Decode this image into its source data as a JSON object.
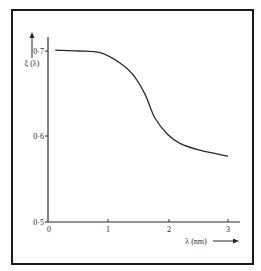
{
  "chart_data": {
    "type": "line",
    "title": "",
    "xlabel": "λ (nm)",
    "ylabel": "ξ (λ)",
    "xlim": [
      0,
      3.2
    ],
    "ylim": [
      0.5,
      0.72
    ],
    "x_ticks": [
      0,
      1,
      2,
      3
    ],
    "x_tick_labels": [
      "0",
      "1",
      "2",
      "3"
    ],
    "y_ticks": [
      0.5,
      0.6,
      0.7
    ],
    "y_tick_labels": [
      "0·5",
      "0·6",
      "0·7"
    ],
    "grid": false,
    "legend": null,
    "series": [
      {
        "name": "ξ(λ)",
        "x": [
          0.12,
          0.5,
          0.87,
          1.2,
          1.42,
          1.62,
          1.78,
          2.0,
          2.2,
          2.53,
          3.0
        ],
        "y": [
          0.701,
          0.7,
          0.698,
          0.686,
          0.672,
          0.649,
          0.622,
          0.602,
          0.592,
          0.584,
          0.577
        ]
      }
    ]
  },
  "axes": {
    "x_label": "λ (nm)",
    "y_label": "ξ (λ)",
    "x_tick_labels": [
      "0",
      "1",
      "2",
      "3"
    ],
    "y_tick_labels": [
      "0·7",
      "0·6",
      "0·5"
    ]
  }
}
